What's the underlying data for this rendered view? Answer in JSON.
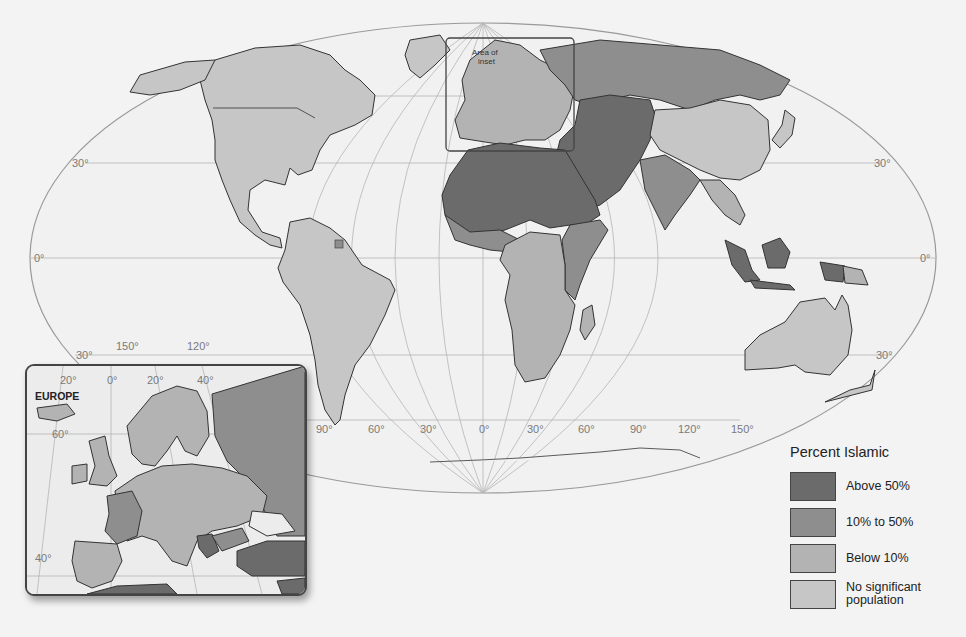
{
  "map": {
    "title": "Percent Islamic",
    "projection": "elliptical world map",
    "graticule_labels": {
      "latitude_left": [
        "30°",
        "0°",
        "30°"
      ],
      "latitude_right": [
        "30°",
        "0°",
        "30°"
      ],
      "longitude_bottom": [
        "90°",
        "60°",
        "30°",
        "0°",
        "30°",
        "60°",
        "90°",
        "120°",
        "150°"
      ],
      "longitude_pacific": [
        "150°",
        "120°"
      ]
    },
    "inset_area_label": "Area of inset",
    "colors": {
      "above_50": "#6b6b6b",
      "10_to_50": "#8e8e8e",
      "below_10": "#b3b3b3",
      "no_significant": "#c6c6c6",
      "ocean": "#f0f0f0",
      "border": "#333333"
    }
  },
  "legend": {
    "title": "Percent Islamic",
    "items": [
      {
        "label": "Above 50%",
        "color": "#6b6b6b"
      },
      {
        "label": "10% to 50%",
        "color": "#8e8e8e"
      },
      {
        "label": "Below 10%",
        "color": "#b3b3b3"
      },
      {
        "label": "No significant population",
        "label_line1": "No significant",
        "label_line2": "population",
        "color": "#c6c6c6"
      }
    ]
  },
  "inset": {
    "title": "EUROPE",
    "longitude_labels": [
      "20°",
      "0°",
      "20°",
      "40°"
    ],
    "latitude_labels": [
      "60°",
      "40°"
    ]
  }
}
